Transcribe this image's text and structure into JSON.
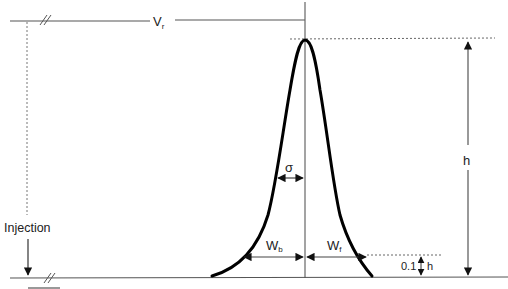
{
  "diagram": {
    "labels": {
      "retention_volume": "V",
      "retention_volume_sub": "r",
      "injection": "Injection",
      "sigma": "σ",
      "height": "h",
      "back_width": "W",
      "back_width_sub": "b",
      "front_width": "W",
      "front_width_sub": "f",
      "tenth_height_prefix": "0.1",
      "tenth_height_suffix": "h"
    },
    "colors": {
      "peak": "#000000",
      "lines": "#555555",
      "text": "#222222"
    }
  }
}
